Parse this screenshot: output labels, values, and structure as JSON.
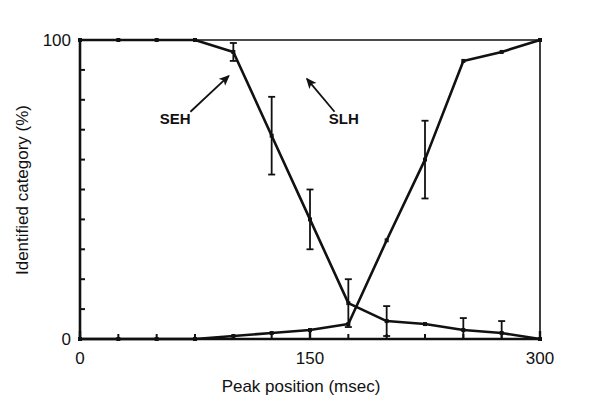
{
  "figure": {
    "background": "#ffffff",
    "ink": "#111111"
  },
  "chart_data": {
    "type": "line",
    "title": "",
    "subtitle": "",
    "xlabel": "Peak position (msec)",
    "ylabel": "Identified category (%)",
    "xlim": [
      0,
      300
    ],
    "ylim": [
      0,
      100
    ],
    "xticks": [
      0,
      150,
      300
    ],
    "xticklabels": [
      "0",
      "150",
      "300"
    ],
    "xminorticks": [
      25,
      50,
      75,
      100,
      125,
      175,
      200,
      225,
      250,
      275
    ],
    "yticks": [
      0,
      100
    ],
    "yticklabels": [
      "0",
      "100"
    ],
    "yminorticks": [
      10,
      20,
      30,
      40,
      50,
      60,
      70,
      80,
      90
    ],
    "grid": false,
    "legend": "none",
    "x": [
      0,
      25,
      50,
      75,
      100,
      125,
      150,
      175,
      200,
      225,
      250,
      275,
      300
    ],
    "series": [
      {
        "name": "SEH",
        "label": "SEH",
        "values": [
          100,
          100,
          100,
          100,
          96,
          68,
          40,
          12,
          6,
          5,
          3,
          2,
          0
        ],
        "errors": [
          0,
          0,
          0,
          0,
          3,
          13,
          10,
          8,
          5,
          0,
          4,
          4,
          0
        ],
        "color": "#111111"
      },
      {
        "name": "SLH",
        "label": "SLH",
        "values": [
          0,
          0,
          0,
          0,
          1,
          2,
          3,
          5,
          33,
          60,
          93,
          96,
          100
        ],
        "errors": [
          0,
          0,
          0,
          0,
          0,
          0,
          0,
          0,
          0,
          13,
          0,
          0,
          0
        ],
        "color": "#111111"
      }
    ],
    "annotations": [
      {
        "text": "SEH",
        "label_x": 62,
        "label_y": 72,
        "arrow_from_x": 72,
        "arrow_from_y": 76,
        "arrow_to_x": 97,
        "arrow_to_y": 88
      },
      {
        "text": "SLH",
        "label_x": 172,
        "label_y": 72,
        "arrow_from_x": 166,
        "arrow_from_y": 76,
        "arrow_to_x": 148,
        "arrow_to_y": 87
      }
    ]
  }
}
